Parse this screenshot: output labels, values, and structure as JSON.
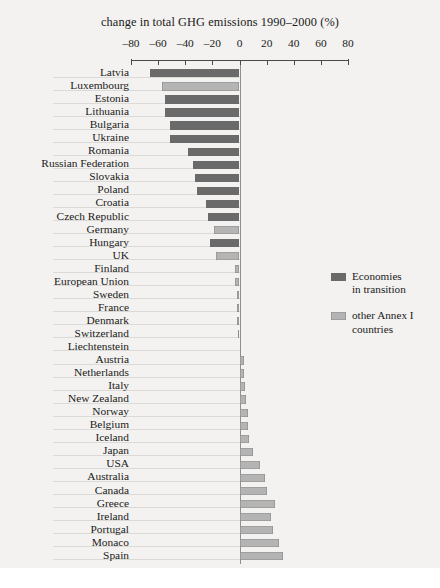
{
  "chart_data": {
    "type": "bar",
    "orientation": "horizontal",
    "title": "change in total GHG emissions 1990–2000 (%)",
    "xlabel": "",
    "ylabel": "",
    "xlim": [
      -80,
      80
    ],
    "xticks": [
      "–80",
      "–60",
      "–40",
      "–20",
      "0",
      "20",
      "40",
      "60",
      "80"
    ],
    "xtick_values": [
      -80,
      -60,
      -40,
      -20,
      0,
      20,
      40,
      60,
      80
    ],
    "grid": false,
    "legend_position": "right-middle",
    "legend": [
      {
        "label": "Economies in transition",
        "line1": "Economies",
        "line2": "in transition",
        "color": "#6a6a6a",
        "key": "transition"
      },
      {
        "label": "other Annex I countries",
        "line1": "other Annex I",
        "line2": "countries",
        "color": "#b4b4b4",
        "key": "annex1"
      }
    ],
    "categories": [
      "Latvia",
      "Luxembourg",
      "Estonia",
      "Lithuania",
      "Bulgaria",
      "Ukraine",
      "Romania",
      "Russian Federation",
      "Slovakia",
      "Poland",
      "Croatia",
      "Czech Republic",
      "Germany",
      "Hungary",
      "UK",
      "Finland",
      "European Union",
      "Sweden",
      "France",
      "Denmark",
      "Switzerland",
      "Liechtenstein",
      "Austria",
      "Netherlands",
      "Italy",
      "New Zealand",
      "Norway",
      "Belgium",
      "Iceland",
      "Japan",
      "USA",
      "Australia",
      "Canada",
      "Greece",
      "Ireland",
      "Portugal",
      "Monaco",
      "Spain"
    ],
    "values": [
      -66,
      -57,
      -55,
      -55,
      -51,
      -51,
      -38,
      -34,
      -33,
      -31,
      -25,
      -23,
      -19,
      -22,
      -17,
      -3,
      -3,
      -2,
      -2,
      -2,
      -1,
      0,
      3,
      3,
      4,
      5,
      6,
      6,
      7,
      10,
      15,
      19,
      20,
      26,
      23,
      25,
      29,
      32
    ],
    "group": [
      "transition",
      "annex1",
      "transition",
      "transition",
      "transition",
      "transition",
      "transition",
      "transition",
      "transition",
      "transition",
      "transition",
      "transition",
      "annex1",
      "transition",
      "annex1",
      "annex1",
      "annex1",
      "annex1",
      "annex1",
      "annex1",
      "annex1",
      "annex1",
      "annex1",
      "annex1",
      "annex1",
      "annex1",
      "annex1",
      "annex1",
      "annex1",
      "annex1",
      "annex1",
      "annex1",
      "annex1",
      "annex1",
      "annex1",
      "annex1",
      "annex1",
      "annex1"
    ],
    "colors": {
      "transition": "#6a6a6a",
      "annex1": "#b4b4b4",
      "axis": "#4a4a4a",
      "background": "#f3f2f0"
    }
  }
}
